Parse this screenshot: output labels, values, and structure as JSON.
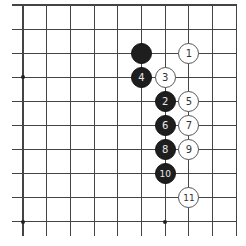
{
  "board": {
    "origin_x": 23,
    "origin_y": 5,
    "spacing_x": 23.7,
    "spacing_y": 24.1,
    "columns": 10,
    "rows": 10,
    "line_color": "#444444",
    "star_points": [
      [
        0,
        3
      ],
      [
        0,
        9
      ],
      [
        6,
        9
      ]
    ]
  },
  "stones": [
    {
      "color": "black",
      "col": 5,
      "row": 2,
      "label": ""
    },
    {
      "color": "white",
      "col": 7,
      "row": 2,
      "label": "1"
    },
    {
      "color": "black",
      "col": 6,
      "row": 4,
      "label": "2"
    },
    {
      "color": "white",
      "col": 6,
      "row": 3,
      "label": "3"
    },
    {
      "color": "black",
      "col": 5,
      "row": 3,
      "label": "4"
    },
    {
      "color": "white",
      "col": 7,
      "row": 4,
      "label": "5"
    },
    {
      "color": "black",
      "col": 6,
      "row": 5,
      "label": "6"
    },
    {
      "color": "white",
      "col": 7,
      "row": 5,
      "label": "7"
    },
    {
      "color": "black",
      "col": 6,
      "row": 6,
      "label": "8"
    },
    {
      "color": "white",
      "col": 7,
      "row": 6,
      "label": "9"
    },
    {
      "color": "black",
      "col": 6,
      "row": 7,
      "label": "10"
    },
    {
      "color": "white",
      "col": 7,
      "row": 8,
      "label": "11"
    }
  ]
}
